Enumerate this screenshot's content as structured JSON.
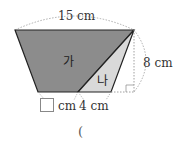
{
  "diagram": {
    "labels": {
      "top_width": "15 cm",
      "height": "8 cm",
      "bottom_right": "4 cm",
      "bottom_left_unit": "cm",
      "region_a": "가",
      "region_b": "나"
    },
    "colors": {
      "region_a_fill": "#8c8c8c",
      "region_b_fill": "#d9d9d9",
      "outline": "#222222",
      "dotted": "#888888"
    },
    "answer_paren": "("
  }
}
